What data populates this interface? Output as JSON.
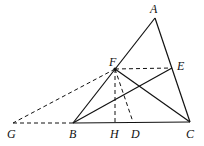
{
  "diagram": {
    "type": "geometry",
    "points": {
      "A": {
        "label": "A",
        "x": 155,
        "y": 18,
        "lx": 150,
        "ly": 13
      },
      "B": {
        "label": "B",
        "x": 73,
        "y": 123,
        "lx": 69,
        "ly": 138
      },
      "C": {
        "label": "C",
        "x": 190,
        "y": 122,
        "lx": 186,
        "ly": 138
      },
      "D": {
        "label": "D",
        "x": 133,
        "y": 122,
        "lx": 131,
        "ly": 138
      },
      "E": {
        "label": "E",
        "x": 172,
        "y": 68,
        "lx": 177,
        "ly": 70
      },
      "F": {
        "label": "F",
        "x": 115,
        "y": 69,
        "lx": 109,
        "ly": 66
      },
      "G": {
        "label": "G",
        "x": 13,
        "y": 123,
        "lx": 7,
        "ly": 138
      },
      "H": {
        "label": "H",
        "x": 115,
        "y": 123,
        "lx": 110,
        "ly": 138
      }
    },
    "solid_segments": [
      "AB",
      "AC",
      "BC",
      "BE",
      "CF"
    ],
    "dashed_segments": [
      "FE",
      "FG",
      "GB",
      "FH",
      "FD"
    ],
    "stroke_color": "#111111"
  }
}
